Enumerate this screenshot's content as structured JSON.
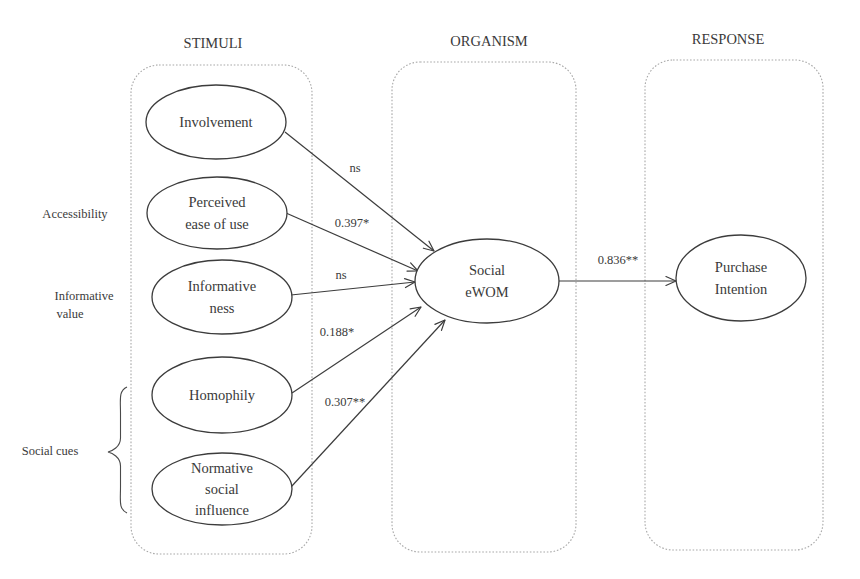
{
  "stages": [
    {
      "id": "stimuli",
      "title": "STIMULI",
      "box": {
        "x": 131,
        "y": 65,
        "w": 181,
        "h": 489,
        "r": 28
      },
      "title_pos": {
        "x": 213,
        "y": 48
      }
    },
    {
      "id": "organism",
      "title": "ORGANISM",
      "box": {
        "x": 392,
        "y": 62,
        "w": 184,
        "h": 490,
        "r": 28
      },
      "title_pos": {
        "x": 489,
        "y": 46
      }
    },
    {
      "id": "response",
      "title": "RESPONSE",
      "box": {
        "x": 645,
        "y": 60,
        "w": 178,
        "h": 490,
        "r": 28
      },
      "title_pos": {
        "x": 728,
        "y": 44
      }
    }
  ],
  "constructs": {
    "involvement": {
      "lines": [
        "Involvement"
      ],
      "cx": 216,
      "cy": 122,
      "rx": 70,
      "ry": 37
    },
    "perceived_ease_of_use": {
      "lines": [
        "Perceived",
        "ease of use"
      ],
      "cx": 217,
      "cy": 213,
      "rx": 70,
      "ry": 36
    },
    "informativeness": {
      "lines": [
        "Informative",
        "ness"
      ],
      "cx": 222,
      "cy": 297,
      "rx": 70,
      "ry": 37
    },
    "homophily": {
      "lines": [
        "Homophily"
      ],
      "cx": 222,
      "cy": 395,
      "rx": 70,
      "ry": 38
    },
    "normative_social_influence": {
      "lines": [
        "Normative",
        "social",
        "influence"
      ],
      "cx": 222,
      "cy": 489,
      "rx": 70,
      "ry": 36
    },
    "social_ewom": {
      "lines": [
        "Social",
        "eWOM"
      ],
      "cx": 487,
      "cy": 281,
      "rx": 72,
      "ry": 42
    },
    "purchase_intention": {
      "lines": [
        "Purchase",
        "Intention"
      ],
      "cx": 741,
      "cy": 278,
      "rx": 65,
      "ry": 43
    }
  },
  "paths": [
    {
      "from": "Involvement",
      "to": "Social eWOM",
      "coefficient": "ns",
      "x1": 285,
      "y1": 132,
      "x2": 434,
      "y2": 251,
      "label_x": 355,
      "label_y": 172
    },
    {
      "from": "Perceived ease of use",
      "to": "Social eWOM",
      "coefficient": "0.397*",
      "x1": 286,
      "y1": 213,
      "x2": 418,
      "y2": 271,
      "label_x": 352,
      "label_y": 227
    },
    {
      "from": "Informativeness",
      "to": "Social eWOM",
      "coefficient": "ns",
      "x1": 291,
      "y1": 295,
      "x2": 415,
      "y2": 282,
      "label_x": 341,
      "label_y": 279
    },
    {
      "from": "Homophily",
      "to": "Social eWOM",
      "coefficient": "0.188*",
      "x1": 292,
      "y1": 393,
      "x2": 421,
      "y2": 307,
      "label_x": 337,
      "label_y": 336
    },
    {
      "from": "Normative social influence",
      "to": "Social eWOM",
      "coefficient": "0.307**",
      "x1": 291,
      "y1": 487,
      "x2": 445,
      "y2": 320,
      "label_x": 345,
      "label_y": 406
    },
    {
      "from": "Social eWOM",
      "to": "Purchase Intention",
      "coefficient": "0.836**",
      "x1": 559,
      "y1": 281,
      "x2": 676,
      "y2": 281,
      "label_x": 618,
      "label_y": 264
    }
  ],
  "side_labels": [
    {
      "id": "accessibility",
      "lines": [
        "Accessibility"
      ],
      "x": 75,
      "y": 218
    },
    {
      "id": "informative_value",
      "lines": [
        "Informative",
        "value"
      ],
      "x": 84,
      "y": 300,
      "align_second_x": 70
    },
    {
      "id": "social_cues",
      "lines": [
        "Social cues"
      ],
      "x": 50,
      "y": 455
    }
  ],
  "brace": {
    "label": "Social cues",
    "x_top": 127,
    "y_top": 387,
    "x_tip": 108,
    "y_tip": 452,
    "y_bottom": 513
  },
  "colors": {
    "stroke": "#3c3c3c",
    "text": "#3a3a3a",
    "dotted_box": "#a8a8a8",
    "background": "#ffffff"
  }
}
